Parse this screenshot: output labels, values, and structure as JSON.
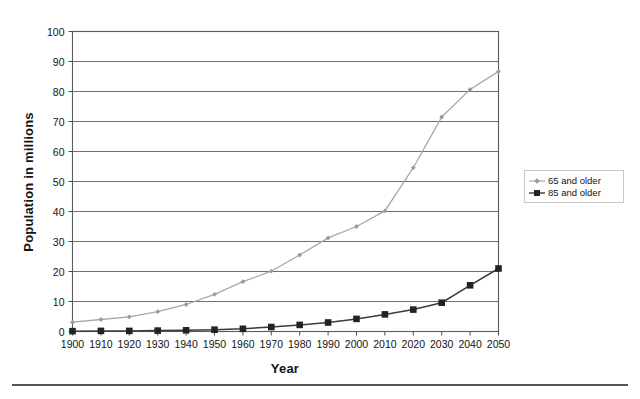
{
  "chart_data": {
    "type": "line",
    "title": "",
    "xlabel": "Year",
    "ylabel": "Population in millions",
    "x": [
      1900,
      1910,
      1920,
      1930,
      1940,
      1950,
      1960,
      1970,
      1980,
      1990,
      2000,
      2010,
      2020,
      2030,
      2040,
      2050
    ],
    "xtick_labels": [
      "1900",
      "1910",
      "1920",
      "1930",
      "1940",
      "1950",
      "1960",
      "1970",
      "1980",
      "1990",
      "2000",
      "2010",
      "2020",
      "2030",
      "2040",
      "2050"
    ],
    "ytick_labels": [
      "0",
      "10",
      "20",
      "30",
      "40",
      "50",
      "60",
      "70",
      "80",
      "90",
      "100"
    ],
    "yticks": [
      0,
      10,
      20,
      30,
      40,
      50,
      60,
      70,
      80,
      90,
      100
    ],
    "ylim": [
      0,
      100
    ],
    "xlim": [
      1900,
      2050
    ],
    "grid": "horizontal",
    "legend_position": "right-middle",
    "series": [
      {
        "name": "65 and older",
        "color": "#a8a8a8",
        "marker": "diamond",
        "values": [
          3.1,
          4.0,
          4.9,
          6.6,
          9.0,
          12.4,
          16.6,
          20.1,
          25.5,
          31.2,
          35.0,
          40.2,
          54.6,
          71.5,
          80.7,
          86.7
        ]
      },
      {
        "name": "85 and older",
        "color": "#232323",
        "marker": "square",
        "values": [
          0.1,
          0.2,
          0.2,
          0.3,
          0.4,
          0.6,
          0.9,
          1.5,
          2.2,
          3.0,
          4.2,
          5.7,
          7.3,
          9.6,
          15.4,
          21.0
        ]
      }
    ]
  },
  "legend": {
    "entries": [
      {
        "label": "65 and older"
      },
      {
        "label": "85 and older"
      }
    ]
  },
  "axis": {
    "y_title": "Population in millions",
    "x_title": "Year"
  }
}
